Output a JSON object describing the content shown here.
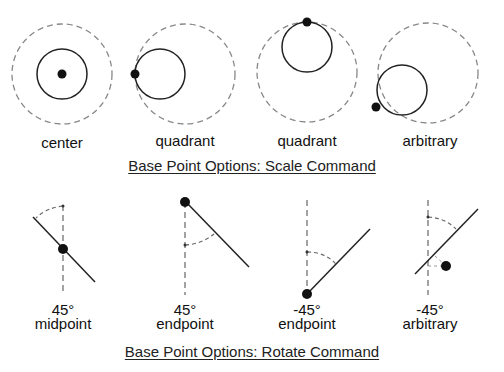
{
  "scale_section": {
    "title": "Base Point Options: Scale Command",
    "examples": [
      {
        "label": "center"
      },
      {
        "label": "quadrant"
      },
      {
        "label": "quadrant"
      },
      {
        "label": "arbitrary"
      }
    ]
  },
  "rotate_section": {
    "title": "Base Point Options: Rotate Command",
    "examples": [
      {
        "angle": "45°",
        "label": "midpoint"
      },
      {
        "angle": "45°",
        "label": "endpoint"
      },
      {
        "angle": "-45°",
        "label": "endpoint"
      },
      {
        "angle": "-45°",
        "label": "arbitrary"
      }
    ]
  },
  "colors": {
    "solid_line": "#222222",
    "dashed_line": "#888888",
    "base_point": "#111111"
  }
}
